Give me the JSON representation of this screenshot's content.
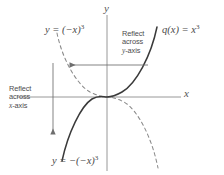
{
  "figure": {
    "background_color": "#ffffff",
    "axis_color": "#8d8d8d",
    "solid_curve_color": "#3a3a3a",
    "dashed_curve_color": "#8a8a8a",
    "arrow_color": "#6e6e6e"
  },
  "axes": {
    "y_label": "y",
    "x_label": "x",
    "origin": {
      "x": 107,
      "y": 97
    }
  },
  "curves": [
    {
      "id": "solid-cubic",
      "style": "solid",
      "label_text": "q(x) = x",
      "label_exponent": "3",
      "label_position": "top-right"
    },
    {
      "id": "dashed-reflected-cubic",
      "style": "dashed",
      "label_text": "y = (−x)",
      "label_exponent": "3",
      "label_position": "top-left"
    },
    {
      "id": "solid-double-reflected",
      "style": "solid",
      "label_text": "y = −(−x)",
      "label_exponent": "3",
      "label_position": "bottom-left"
    }
  ],
  "annotations": [
    {
      "id": "reflect-y-axis",
      "line1": "Reflect",
      "line2": "across",
      "line3_italic": "y",
      "line3_rest": "-axis",
      "arrow_direction": "left"
    },
    {
      "id": "reflect-x-axis",
      "line1": "Reflect",
      "line2": "across",
      "line3_italic": "x",
      "line3_rest": "-axis",
      "arrow_direction": "down"
    }
  ]
}
